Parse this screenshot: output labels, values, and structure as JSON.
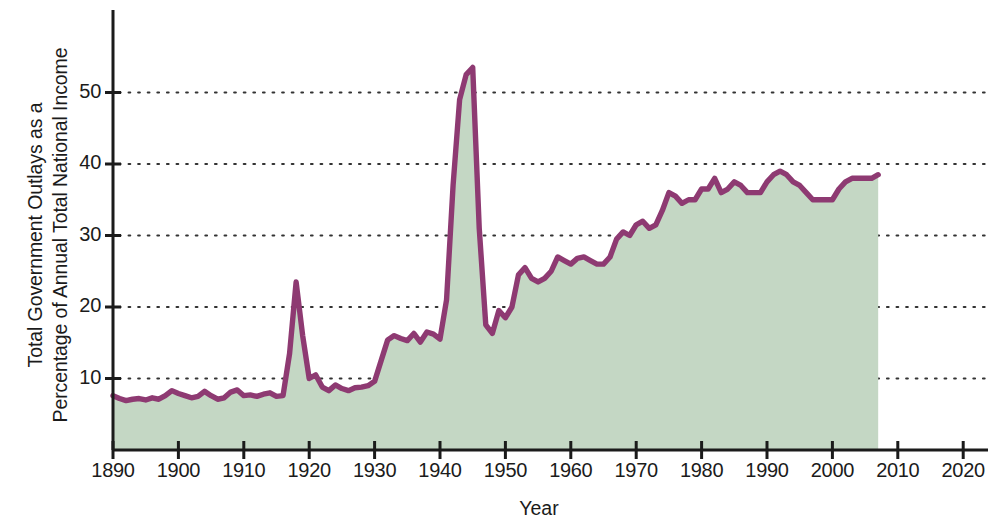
{
  "chart_data": {
    "type": "area",
    "title": "",
    "xlabel": "Year",
    "ylabel": "Total Government Outlays as a\nPercentage of Annual Total National Income",
    "xlim": [
      1890,
      2024
    ],
    "ylim": [
      0,
      58
    ],
    "grid": "horizontal-dotted",
    "legend": "none",
    "series_name": "Total Government Outlays",
    "line_color": "#8e3a72",
    "fill_color": "#c4d7c4",
    "axis_color": "#1b1b1b",
    "grid_color": "#333333",
    "x_ticks": [
      1890,
      1900,
      1910,
      1920,
      1930,
      1940,
      1950,
      1960,
      1970,
      1980,
      1990,
      2000,
      2010,
      2020
    ],
    "x_tick_labels": [
      "1890",
      "1900",
      "1910",
      "1920",
      "1930",
      "1940",
      "1950",
      "1960",
      "1970",
      "1980",
      "1990",
      "2000",
      "2010",
      "2020"
    ],
    "y_ticks": [
      10,
      20,
      30,
      40,
      50
    ],
    "y_tick_labels": [
      "10",
      "20",
      "30",
      "40",
      "50"
    ],
    "x": [
      1890,
      1891,
      1892,
      1893,
      1894,
      1895,
      1896,
      1897,
      1898,
      1899,
      1900,
      1901,
      1902,
      1903,
      1904,
      1905,
      1906,
      1907,
      1908,
      1909,
      1910,
      1911,
      1912,
      1913,
      1914,
      1915,
      1916,
      1917,
      1918,
      1919,
      1920,
      1921,
      1922,
      1923,
      1924,
      1925,
      1926,
      1927,
      1928,
      1929,
      1930,
      1931,
      1932,
      1933,
      1934,
      1935,
      1936,
      1937,
      1938,
      1939,
      1940,
      1941,
      1942,
      1943,
      1944,
      1945,
      1946,
      1947,
      1948,
      1949,
      1950,
      1951,
      1952,
      1953,
      1954,
      1955,
      1956,
      1957,
      1958,
      1959,
      1960,
      1961,
      1962,
      1963,
      1964,
      1965,
      1966,
      1967,
      1968,
      1969,
      1970,
      1971,
      1972,
      1973,
      1974,
      1975,
      1976,
      1977,
      1978,
      1979,
      1980,
      1981,
      1982,
      1983,
      1984,
      1985,
      1986,
      1987,
      1988,
      1989,
      1990,
      1991,
      1992,
      1993,
      1994,
      1995,
      1996,
      1997,
      1998,
      1999,
      2000,
      2001,
      2002,
      2003,
      2004,
      2005,
      2006,
      2007
    ],
    "values": [
      7.6,
      7.2,
      6.9,
      7.1,
      7.2,
      7.0,
      7.3,
      7.1,
      7.6,
      8.3,
      7.9,
      7.6,
      7.3,
      7.5,
      8.2,
      7.6,
      7.1,
      7.3,
      8.1,
      8.4,
      7.6,
      7.7,
      7.5,
      7.8,
      8.0,
      7.5,
      7.6,
      13.5,
      23.5,
      16.0,
      10.0,
      10.5,
      8.8,
      8.3,
      9.1,
      8.6,
      8.3,
      8.7,
      8.8,
      9.0,
      9.6,
      12.5,
      15.4,
      16.0,
      15.6,
      15.3,
      16.3,
      15.1,
      16.5,
      16.2,
      15.5,
      21.0,
      37.0,
      49.0,
      52.5,
      53.5,
      31.0,
      17.5,
      16.3,
      19.5,
      18.5,
      20.0,
      24.5,
      25.5,
      24.0,
      23.5,
      24.0,
      25.0,
      27.0,
      26.5,
      26.0,
      26.8,
      27.0,
      26.5,
      26.0,
      26.0,
      27.0,
      29.5,
      30.5,
      30.0,
      31.5,
      32.0,
      31.0,
      31.5,
      33.5,
      36.0,
      35.5,
      34.5,
      35.0,
      35.0,
      36.5,
      36.5,
      38.0,
      36.0,
      36.5,
      37.5,
      37.0,
      36.0,
      36.0,
      36.0,
      37.5,
      38.5,
      39.0,
      38.5,
      37.5,
      37.0,
      36.0,
      35.0,
      35.0,
      35.0,
      35.0,
      36.5,
      37.5,
      38.0,
      38.0,
      38.0,
      38.0,
      38.5
    ]
  }
}
